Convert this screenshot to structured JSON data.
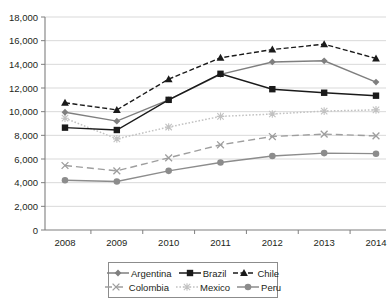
{
  "chart_data": {
    "type": "line",
    "title": "",
    "xlabel": "",
    "ylabel": "",
    "categories": [
      "2008",
      "2009",
      "2010",
      "2011",
      "2012",
      "2013",
      "2014"
    ],
    "x": [
      2008,
      2009,
      2010,
      2011,
      2012,
      2013,
      2014
    ],
    "ylim": [
      0,
      18000
    ],
    "ytick_values": [
      0,
      2000,
      4000,
      6000,
      8000,
      10000,
      12000,
      14000,
      16000,
      18000
    ],
    "ytick_labels": [
      "0",
      "2,000",
      "4,000",
      "6,000",
      "8,000",
      "10,000",
      "12,000",
      "14,000",
      "16,000",
      "18,000"
    ],
    "grid": true,
    "legend_position": "bottom",
    "series": [
      {
        "name": "Argentina",
        "values": [
          9950,
          9200,
          11000,
          13150,
          14200,
          14300,
          12500
        ],
        "color": "#7f7f7f",
        "marker": "diamond",
        "dash": "solid"
      },
      {
        "name": "Brazil",
        "values": [
          8650,
          8450,
          11000,
          13200,
          11900,
          11600,
          11350
        ],
        "color": "#1a1a1a",
        "marker": "square",
        "dash": "solid"
      },
      {
        "name": "Chile",
        "values": [
          10750,
          10150,
          12750,
          14550,
          15250,
          15700,
          14500
        ],
        "color": "#1a1a1a",
        "marker": "triangle",
        "dash": "dashed"
      },
      {
        "name": "Colombia",
        "values": [
          5450,
          5000,
          6100,
          7200,
          7900,
          8100,
          7950
        ],
        "color": "#9e9e9e",
        "marker": "x",
        "dash": "longdash"
      },
      {
        "name": "Mexico",
        "values": [
          9450,
          7700,
          8700,
          9600,
          9800,
          10050,
          10150
        ],
        "color": "#c2c2c2",
        "marker": "asterisk",
        "dash": "dotted"
      },
      {
        "name": "Peru",
        "values": [
          4200,
          4100,
          5000,
          5700,
          6250,
          6500,
          6450
        ],
        "color": "#8c8c8c",
        "marker": "circle",
        "dash": "solid"
      }
    ]
  },
  "legend": {
    "row1": [
      "Argentina",
      "Brazil",
      "Chile"
    ],
    "row2": [
      "Colombia",
      "Mexico",
      "Peru"
    ]
  }
}
